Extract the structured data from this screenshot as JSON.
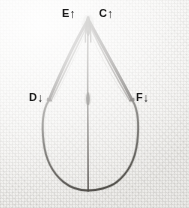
{
  "figure": {
    "medium_description": "pencil/ink line drawing on woven paper, scanned",
    "background_color": "#f4f3f1",
    "ink_color": "#3a3733",
    "label_color": "#1a1a1a",
    "width": 189,
    "height": 208
  },
  "labels": [
    {
      "id": "E",
      "letter": "E",
      "arrow": "↑",
      "arrow_direction": "up",
      "name": "label-E",
      "position": {
        "x": 62,
        "y": 8
      }
    },
    {
      "id": "C",
      "letter": "C",
      "arrow": "↑",
      "arrow_direction": "up",
      "name": "label-C",
      "position": {
        "x": 99,
        "y": 8
      }
    },
    {
      "id": "D",
      "letter": "D",
      "arrow": "↓",
      "arrow_direction": "down",
      "name": "label-D",
      "position": {
        "x": 29,
        "y": 92
      }
    },
    {
      "id": "F",
      "letter": "F",
      "arrow": "↓",
      "arrow_direction": "down",
      "name": "label-F",
      "position": {
        "x": 136,
        "y": 92
      }
    }
  ],
  "geometry": {
    "apex": {
      "x": 88,
      "y": 20
    },
    "left_node": {
      "x": 48,
      "y": 101
    },
    "right_node": {
      "x": 133,
      "y": 101
    },
    "center_node": {
      "x": 88,
      "y": 100
    },
    "bottom": {
      "x": 88,
      "y": 190
    },
    "bulb_left_extent": 43,
    "bulb_right_extent": 139
  }
}
